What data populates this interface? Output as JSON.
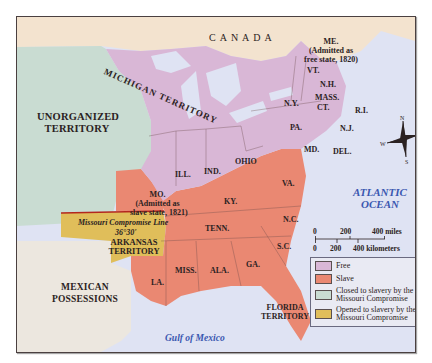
{
  "map": {
    "title_region": "Missouri Compromise, 1820-1821",
    "colors": {
      "free": "#d9b7d6",
      "slave": "#ea8872",
      "closed": "#c9dcd2",
      "opened": "#e0be5a",
      "mexican": "#ece7df",
      "canada": "#f3e3cf",
      "water": "#dfe3f3",
      "water_label": "#3a57b0",
      "compromise_line": "#b3261e"
    },
    "regions": {
      "canada": "CANADA",
      "unorganized": "UNORGANIZED TERRITORY",
      "unorganized_l1": "UNORGANIZED",
      "unorganized_l2": "TERRITORY",
      "michigan": "MICHIGAN TERRITORY",
      "arkansas_l1": "ARKANSAS",
      "arkansas_l2": "TERRITORY",
      "mexican_l1": "MEXICAN",
      "mexican_l2": "POSSESSIONS",
      "florida_l1": "FLORIDA",
      "florida_l2": "TERRITORY"
    },
    "states": {
      "me": "ME.",
      "me_note_l1": "(Admitted as",
      "me_note_l2": "free state, 1820)",
      "vt": "VT.",
      "nh": "N.H.",
      "ny": "N.Y.",
      "mass": "MASS.",
      "ct": "CT.",
      "ri": "R.I.",
      "pa": "PA.",
      "nj": "N.J.",
      "md": "MD.",
      "del": "DEL.",
      "ohio": "OHIO",
      "ind": "IND.",
      "ill": "ILL.",
      "mo": "MO.",
      "mo_note_l1": "(Admitted as",
      "mo_note_l2": "slave state, 1821)",
      "ky": "KY.",
      "va": "VA.",
      "tenn": "TENN.",
      "nc": "N.C.",
      "sc": "S.C.",
      "ga": "GA.",
      "ala": "ALA.",
      "miss": "MISS.",
      "la": "LA."
    },
    "water": {
      "atlantic_l1": "ATLANTIC",
      "atlantic_l2": "OCEAN",
      "gulf": "Gulf of Mexico"
    },
    "compromise": {
      "line_label": "Missouri Compromise Line",
      "latitude": "36°30'"
    },
    "compass": {
      "n": "N",
      "s": "S",
      "e": "E",
      "w": "W"
    },
    "scale": {
      "miles": [
        "0",
        "200",
        "400 miles"
      ],
      "km": [
        "0",
        "200",
        "400 kilometers"
      ]
    },
    "legend": [
      {
        "label": "Free",
        "color": "#d9b7d6"
      },
      {
        "label": "Slave",
        "color": "#ea8872"
      },
      {
        "label": "Closed to slavery by the Missouri Compromise",
        "color": "#c9dcd2"
      },
      {
        "label": "Opened to slavery by the Missouri Compromise",
        "color": "#e0be5a"
      }
    ]
  }
}
